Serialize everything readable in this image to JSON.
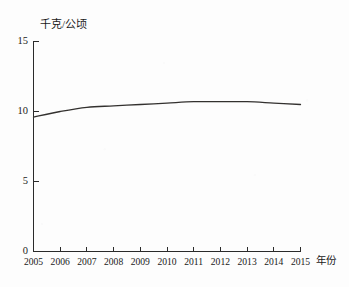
{
  "chart_data": {
    "type": "line",
    "title": "",
    "subtitle": "",
    "xlabel": "年份",
    "ylabel": "千克/公顷",
    "x": [
      2005,
      2006,
      2007,
      2008,
      2009,
      2010,
      2011,
      2012,
      2013,
      2014,
      2015
    ],
    "categories": [
      "2005",
      "2006",
      "2007",
      "2008",
      "2009",
      "2010",
      "2011",
      "2012",
      "2013",
      "2014",
      "2015"
    ],
    "values": [
      9.6,
      10.0,
      10.3,
      10.4,
      10.5,
      10.6,
      10.7,
      10.7,
      10.7,
      10.6,
      10.5
    ],
    "series": [
      {
        "name": "千克/公顷",
        "values": [
          9.6,
          10.0,
          10.3,
          10.4,
          10.5,
          10.6,
          10.7,
          10.7,
          10.7,
          10.6,
          10.5
        ]
      }
    ],
    "xlim": [
      2005,
      2015
    ],
    "ylim": [
      0,
      15
    ],
    "yticks": [
      0,
      5,
      10,
      15
    ],
    "ytick_labels": [
      "0",
      "5",
      "10",
      "15"
    ],
    "xticks": [
      2005,
      2006,
      2007,
      2008,
      2009,
      2010,
      2011,
      2012,
      2013,
      2014,
      2015
    ],
    "xtick_labels": [
      "2005",
      "2006",
      "2007",
      "2008",
      "2009",
      "2010",
      "2011",
      "2012",
      "2013",
      "2014",
      "2015"
    ],
    "grid": false,
    "legend": false,
    "legend_position": "none",
    "line_color": "#33312f",
    "axis_color": "#2a2a2a",
    "background_color": "#fdfdfd",
    "annotations": []
  },
  "axis": {
    "y_unit_label": "千克/公顷",
    "x_unit_label": "年份"
  }
}
